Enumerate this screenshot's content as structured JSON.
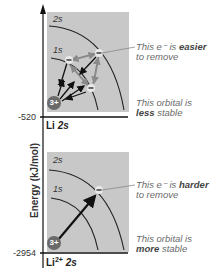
{
  "axis": {
    "ylabel": "Energy (kJ/mol)",
    "ticks": [
      "-520",
      "-2954"
    ]
  },
  "panels": [
    {
      "level_label": "Li",
      "level_sup": "",
      "level_orbital": "2s",
      "orbital_labels": [
        "2s",
        "1s"
      ],
      "nucleus": "3+",
      "callout_electron_pre": "This e⁻ is ",
      "callout_electron_bold": "easier",
      "callout_electron_post": "to remove",
      "callout_orbital_pre": "This orbital is",
      "callout_orbital_bold": "less",
      "callout_orbital_post": "stable"
    },
    {
      "level_label": "Li",
      "level_sup": "2+",
      "level_orbital": "2s",
      "orbital_labels": [
        "2s",
        "1s"
      ],
      "nucleus": "3+",
      "callout_electron_pre": "This e⁻ is ",
      "callout_electron_bold": "harder",
      "callout_electron_post": "to remove",
      "callout_orbital_pre": "This orbital is",
      "callout_orbital_bold": "more",
      "callout_orbital_post": "stable"
    }
  ],
  "colors": {
    "panel_bg": "#c8c8c8",
    "nucleus": "#6a6a6a",
    "arrow_dark": "#111111",
    "arrow_light": "#8a8a8a"
  }
}
